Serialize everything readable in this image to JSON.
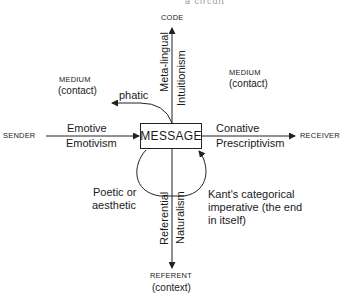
{
  "diagram": {
    "header_fragment": "a circuit",
    "center": {
      "label": "MESSAGE"
    },
    "nodes": {
      "top": "CODE",
      "left": "SENDER",
      "right": "RECEIVER",
      "bottom": {
        "line1": "REFERENT",
        "line2": "(context)"
      }
    },
    "medium_left": {
      "line1": "MEDIUM",
      "line2": "(contact)"
    },
    "medium_right": {
      "line1": "MEDIUM",
      "line2": "(contact)"
    },
    "functions": {
      "phatic": "phatic",
      "metalingual": "Meta-lingual",
      "intuitionism": "Intuitionism",
      "emotive": "Emotive",
      "emotivism": "Emotivism",
      "conative": "Conative",
      "prescriptivism": "Prescriptivism",
      "poetic": {
        "line1": "Poetic or",
        "line2": "aesthetic"
      },
      "kant": {
        "line1": "Kant's categorical",
        "line2": "imperative (the end",
        "line3": "in itself)"
      },
      "referential": "Referential",
      "naturalism": "Naturalism"
    },
    "colors": {
      "line": "#222222",
      "text": "#1a1a1a",
      "background": "#ffffff"
    }
  }
}
